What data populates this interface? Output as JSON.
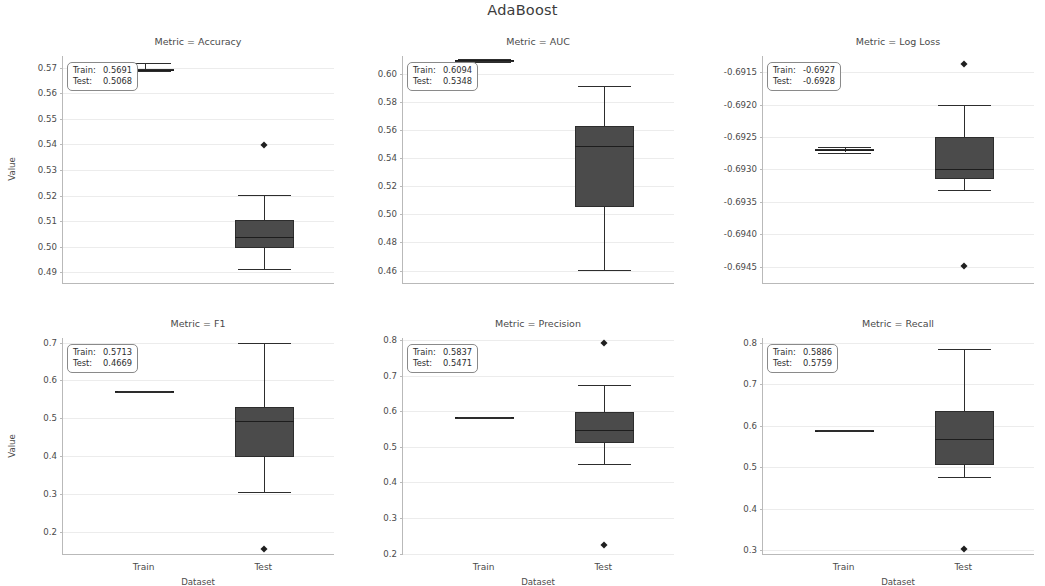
{
  "figure": {
    "title": "AdaBoost",
    "xlabel": "Dataset",
    "ylabel": "Value",
    "categories": [
      "Train",
      "Test"
    ],
    "box_color": "#4b4b4b",
    "grid_color": "#ececec",
    "axis_color": "#b9b9b9"
  },
  "chart_data": {
    "type": "box",
    "title": "AdaBoost",
    "xlabel": "Dataset",
    "ylabel": "Value",
    "categories": [
      "Train",
      "Test"
    ],
    "grid": true,
    "legend": "none",
    "panels": [
      {
        "title": "Metric = Accuracy",
        "metric": "Accuracy",
        "ylim": [
          0.4855,
          0.5745
        ],
        "yticks": [
          "0.49",
          "0.50",
          "0.51",
          "0.52",
          "0.53",
          "0.54",
          "0.55",
          "0.56",
          "0.57"
        ],
        "ytick_values": [
          0.49,
          0.5,
          0.51,
          0.52,
          0.53,
          0.54,
          0.55,
          0.56,
          0.57
        ],
        "annotation": {
          "train_label": "Train:",
          "train_value": "0.5691",
          "test_label": "Test:",
          "test_value": "0.5068"
        },
        "boxes": [
          {
            "group": "Train",
            "whisker_low": 0.5685,
            "q1": 0.5688,
            "median": 0.5691,
            "q3": 0.5693,
            "whisker_high": 0.5716,
            "fliers": []
          },
          {
            "group": "Test",
            "whisker_low": 0.4912,
            "q1": 0.4997,
            "median": 0.504,
            "q3": 0.5103,
            "whisker_high": 0.5201,
            "fliers": [
              0.5397
            ]
          }
        ]
      },
      {
        "title": "Metric = AUC",
        "metric": "AUC",
        "ylim": [
          0.4505,
          0.6125
        ],
        "yticks": [
          "0.46",
          "0.48",
          "0.50",
          "0.52",
          "0.54",
          "0.56",
          "0.58",
          "0.60"
        ],
        "ytick_values": [
          0.46,
          0.48,
          0.5,
          0.52,
          0.54,
          0.56,
          0.58,
          0.6
        ],
        "annotation": {
          "train_label": "Train:",
          "train_value": "0.6094",
          "test_label": "Test:",
          "test_value": "0.5348"
        },
        "boxes": [
          {
            "group": "Train",
            "whisker_low": 0.6085,
            "q1": 0.609,
            "median": 0.6094,
            "q3": 0.6097,
            "whisker_high": 0.6102,
            "fliers": []
          },
          {
            "group": "Test",
            "whisker_low": 0.4606,
            "q1": 0.5053,
            "median": 0.5483,
            "q3": 0.5625,
            "whisker_high": 0.5911,
            "fliers": []
          }
        ]
      },
      {
        "title": "Metric = Log Loss",
        "metric": "Log Loss",
        "ylim": [
          -0.69477,
          -0.69125
        ],
        "yticks": [
          "-0.6915",
          "-0.6920",
          "-0.6925",
          "-0.6930",
          "-0.6935",
          "-0.6940",
          "-0.6945"
        ],
        "ytick_values": [
          -0.6915,
          -0.692,
          -0.6925,
          -0.693,
          -0.6935,
          -0.694,
          -0.6945
        ],
        "annotation": {
          "train_label": "Train:",
          "train_value": "-0.6927",
          "test_label": "Test:",
          "test_value": "-0.6928"
        },
        "boxes": [
          {
            "group": "Train",
            "whisker_low": -0.69274,
            "q1": -0.69272,
            "median": -0.6927,
            "q3": -0.69268,
            "whisker_high": -0.69266,
            "fliers": []
          },
          {
            "group": "Test",
            "whisker_low": -0.69332,
            "q1": -0.69315,
            "median": -0.693,
            "q3": -0.6925,
            "whisker_high": -0.692,
            "fliers": [
              -0.69138,
              -0.69449
            ]
          }
        ]
      },
      {
        "title": "Metric = F1",
        "metric": "F1",
        "ylim": [
          0.138,
          0.712
        ],
        "yticks": [
          "0.2",
          "0.3",
          "0.4",
          "0.5",
          "0.6",
          "0.7"
        ],
        "ytick_values": [
          0.2,
          0.3,
          0.4,
          0.5,
          0.6,
          0.7
        ],
        "annotation": {
          "train_label": "Train:",
          "train_value": "0.5713",
          "test_label": "Test:",
          "test_value": "0.4669"
        },
        "boxes": [
          {
            "group": "Train",
            "whisker_low": 0.5705,
            "q1": 0.571,
            "median": 0.5713,
            "q3": 0.5716,
            "whisker_high": 0.5721,
            "fliers": []
          },
          {
            "group": "Test",
            "whisker_low": 0.3052,
            "q1": 0.3985,
            "median": 0.493,
            "q3": 0.53,
            "whisker_high": 0.6985,
            "fliers": [
              0.1528
            ]
          }
        ]
      },
      {
        "title": "Metric = Precision",
        "metric": "Precision",
        "ylim": [
          0.196,
          0.806
        ],
        "yticks": [
          "0.2",
          "0.3",
          "0.4",
          "0.5",
          "0.6",
          "0.7",
          "0.8"
        ],
        "ytick_values": [
          0.2,
          0.3,
          0.4,
          0.5,
          0.6,
          0.7,
          0.8
        ],
        "annotation": {
          "train_label": "Train:",
          "train_value": "0.5837",
          "test_label": "Test:",
          "test_value": "0.5471"
        },
        "boxes": [
          {
            "group": "Train",
            "whisker_low": 0.583,
            "q1": 0.5834,
            "median": 0.5837,
            "q3": 0.584,
            "whisker_high": 0.5845,
            "fliers": []
          },
          {
            "group": "Test",
            "whisker_low": 0.4508,
            "q1": 0.5098,
            "median": 0.5478,
            "q3": 0.5973,
            "whisker_high": 0.6728,
            "fliers": [
              0.793,
              0.2236
            ]
          }
        ]
      },
      {
        "title": "Metric = Recall",
        "metric": "Recall",
        "ylim": [
          0.288,
          0.812
        ],
        "yticks": [
          "0.3",
          "0.4",
          "0.5",
          "0.6",
          "0.7",
          "0.8"
        ],
        "ytick_values": [
          0.3,
          0.4,
          0.5,
          0.6,
          0.7,
          0.8
        ],
        "annotation": {
          "train_label": "Train:",
          "train_value": "0.5886",
          "test_label": "Test:",
          "test_value": "0.5759"
        },
        "boxes": [
          {
            "group": "Train",
            "whisker_low": 0.5878,
            "q1": 0.5883,
            "median": 0.5886,
            "q3": 0.5889,
            "whisker_high": 0.5894,
            "fliers": []
          },
          {
            "group": "Test",
            "whisker_low": 0.4767,
            "q1": 0.5047,
            "median": 0.5692,
            "q3": 0.6355,
            "whisker_high": 0.786,
            "fliers": [
              0.303
            ]
          }
        ]
      }
    ]
  }
}
